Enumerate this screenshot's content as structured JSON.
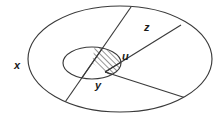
{
  "figure": {
    "background_color": "#ffffff",
    "stroke_color": "#3a3a3a",
    "hatch_color": "#4a4a4a",
    "label_color": "#1a1a1a"
  },
  "labels": {
    "outer_set": "x",
    "inner_set": "y",
    "hatched_region": "u",
    "sector_region": "z"
  },
  "shapes": {
    "outer_ellipse": {
      "name": "outer-boundary-ellipse",
      "cx": 120,
      "cy": 59,
      "rx": 92,
      "ry": 53
    },
    "inner_ellipse": {
      "name": "inner-boundary-ellipse",
      "cx": 92,
      "cy": 63,
      "rx": 29,
      "ry": 16
    },
    "divider_line_1": {
      "name": "divider-line-left",
      "x1": 131,
      "y1": 7,
      "x2": 61,
      "y2": 108
    },
    "divider_line_2": {
      "name": "divider-line-right",
      "x1": 181,
      "y1": 25,
      "x2": 186,
      "y2": 98
    }
  },
  "label_positions": {
    "outer_set": {
      "x": 14,
      "y": 69
    },
    "inner_set": {
      "x": 95,
      "y": 89
    },
    "hatched_region": {
      "x": 122,
      "y": 60
    },
    "sector_region": {
      "x": 144,
      "y": 31
    }
  }
}
